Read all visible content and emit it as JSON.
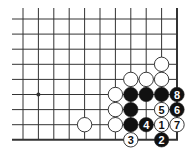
{
  "diagram": {
    "type": "go-board-corner",
    "grid": {
      "columns": 11,
      "rows": 9,
      "origin_x": 23,
      "origin_y": 19,
      "spacing_x": 15.4,
      "spacing_y": 15.1,
      "right_edge": true,
      "bottom_edge": true,
      "extend_left": 11,
      "extend_top": 11
    },
    "hoshi": [
      {
        "col": 1,
        "row": 5
      }
    ],
    "colors": {
      "line": "#333333",
      "black_stone": "#111111",
      "white_stone": "#ffffff",
      "stone_outline": "#222222"
    },
    "stones": [
      {
        "col": 9,
        "row": 3,
        "color": "white",
        "label": ""
      },
      {
        "col": 7,
        "row": 4,
        "color": "white",
        "label": ""
      },
      {
        "col": 8,
        "row": 4,
        "color": "white",
        "label": ""
      },
      {
        "col": 9,
        "row": 4,
        "color": "white",
        "label": ""
      },
      {
        "col": 6,
        "row": 5,
        "color": "white",
        "label": ""
      },
      {
        "col": 7,
        "row": 5,
        "color": "black",
        "label": ""
      },
      {
        "col": 8,
        "row": 5,
        "color": "black",
        "label": ""
      },
      {
        "col": 9,
        "row": 5,
        "color": "black",
        "label": ""
      },
      {
        "col": 10,
        "row": 5,
        "color": "black",
        "label": "8"
      },
      {
        "col": 6,
        "row": 6,
        "color": "white",
        "label": ""
      },
      {
        "col": 7,
        "row": 6,
        "color": "black",
        "label": ""
      },
      {
        "col": 9,
        "row": 6,
        "color": "white",
        "label": "5"
      },
      {
        "col": 10,
        "row": 6,
        "color": "black",
        "label": "6"
      },
      {
        "col": 4,
        "row": 7,
        "color": "white",
        "label": ""
      },
      {
        "col": 6,
        "row": 7,
        "color": "white",
        "label": ""
      },
      {
        "col": 7,
        "row": 7,
        "color": "black",
        "label": ""
      },
      {
        "col": 8,
        "row": 7,
        "color": "black",
        "label": "4"
      },
      {
        "col": 9,
        "row": 7,
        "color": "white",
        "label": "1"
      },
      {
        "col": 10,
        "row": 7,
        "color": "white",
        "label": "7"
      },
      {
        "col": 7,
        "row": 8,
        "color": "white",
        "label": "3"
      },
      {
        "col": 9,
        "row": 8,
        "color": "black",
        "label": "2"
      }
    ]
  }
}
